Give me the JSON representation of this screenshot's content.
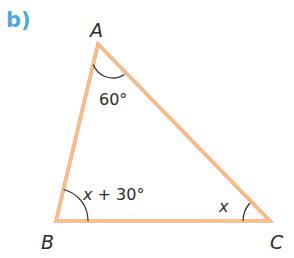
{
  "part_label": "b)",
  "triangle": {
    "vertices": {
      "A": {
        "label": "A",
        "x": 98,
        "y": 44
      },
      "B": {
        "label": "B",
        "x": 56,
        "y": 221
      },
      "C": {
        "label": "C",
        "x": 270,
        "y": 221
      }
    },
    "angles": {
      "A": "60°",
      "B_var": "x",
      "B_rest": " + 30°",
      "C": "x"
    }
  },
  "colors": {
    "edge_outer": "#f2a0a0",
    "edge_inner": "#f7c060",
    "edge_core": "#f5a95c",
    "arc": "#2b2b2b",
    "text": "#2b2b2b",
    "part_label": "#4fa8dc"
  }
}
